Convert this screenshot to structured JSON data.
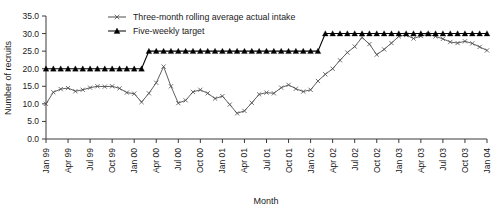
{
  "chart_data": {
    "type": "line",
    "title": "",
    "xlabel": "Month",
    "ylabel": "Number of recruits",
    "ylim": [
      0,
      35
    ],
    "ytick_step": 5,
    "yticks": [
      "0.0",
      "5.0",
      "10.0",
      "15.0",
      "20.0",
      "25.0",
      "30.0",
      "35.0"
    ],
    "grid": false,
    "legend_position": "top-center",
    "x_start": "Jan 99",
    "x_end": "Jan 04",
    "xtick_labels": [
      "Jan 99",
      "Apr 99",
      "Jul 99",
      "Oct 99",
      "Jan 00",
      "Apr 00",
      "Jul 00",
      "Oct 00",
      "Jan 01",
      "Apr 01",
      "Jul 01",
      "Oct 01",
      "Jan 02",
      "Apr 02",
      "Jul 02",
      "Oct 02",
      "Jan 03",
      "Apr 03",
      "Jul 03",
      "Oct 03",
      "Jan 04"
    ],
    "x": [
      "Jan 99",
      "Feb 99",
      "Mar 99",
      "Apr 99",
      "May 99",
      "Jun 99",
      "Jul 99",
      "Aug 99",
      "Sep 99",
      "Oct 99",
      "Nov 99",
      "Dec 99",
      "Jan 00",
      "Feb 00",
      "Mar 00",
      "Apr 00",
      "May 00",
      "Jun 00",
      "Jul 00",
      "Aug 00",
      "Sep 00",
      "Oct 00",
      "Nov 00",
      "Dec 00",
      "Jan 01",
      "Feb 01",
      "Mar 01",
      "Apr 01",
      "May 01",
      "Jun 01",
      "Jul 01",
      "Aug 01",
      "Sep 01",
      "Oct 01",
      "Nov 01",
      "Dec 01",
      "Jan 02",
      "Feb 02",
      "Mar 02",
      "Apr 02",
      "May 02",
      "Jun 02",
      "Jul 02",
      "Aug 02",
      "Sep 02",
      "Oct 02",
      "Nov 02",
      "Dec 02",
      "Jan 03",
      "Feb 03",
      "Mar 03",
      "Apr 03",
      "May 03",
      "Jun 03",
      "Jul 03",
      "Aug 03",
      "Sep 03",
      "Oct 03",
      "Nov 03",
      "Dec 03",
      "Jan 04"
    ],
    "series": [
      {
        "name": "Three-month rolling average actual intake",
        "marker": "x",
        "color": "#4d4d4d",
        "values": [
          10.0,
          13.3,
          14.2,
          14.5,
          13.6,
          14.0,
          14.6,
          15.0,
          14.9,
          15.0,
          14.4,
          13.2,
          12.9,
          10.5,
          13.0,
          16.0,
          20.6,
          15.0,
          10.2,
          11.0,
          13.4,
          14.0,
          13.0,
          11.5,
          12.2,
          9.8,
          7.3,
          8.0,
          10.3,
          12.7,
          13.2,
          13.0,
          14.6,
          15.4,
          14.3,
          13.5,
          14.0,
          16.5,
          18.4,
          20.0,
          22.4,
          24.6,
          26.3,
          28.9,
          27.0,
          24.0,
          25.5,
          27.3,
          29.2,
          29.6,
          28.6,
          29.3,
          29.8,
          29.2,
          28.5,
          27.6,
          27.3,
          27.8,
          27.2,
          26.2,
          25.2
        ]
      },
      {
        "name": "Five-weekly target",
        "marker": "triangle",
        "color": "#000000",
        "values": [
          20,
          20,
          20,
          20,
          20,
          20,
          20,
          20,
          20,
          20,
          20,
          20,
          20,
          20,
          25,
          25,
          25,
          25,
          25,
          25,
          25,
          25,
          25,
          25,
          25,
          25,
          25,
          25,
          25,
          25,
          25,
          25,
          25,
          25,
          25,
          25,
          25,
          25,
          30,
          30,
          30,
          30,
          30,
          30,
          30,
          30,
          30,
          30,
          30,
          30,
          30,
          30,
          30,
          30,
          30,
          30,
          30,
          30,
          30,
          30,
          30
        ]
      }
    ]
  },
  "legend": {
    "items": [
      {
        "label": "Three-month rolling average actual intake",
        "marker": "x"
      },
      {
        "label": "Five-weekly target",
        "marker": "triangle"
      }
    ]
  }
}
